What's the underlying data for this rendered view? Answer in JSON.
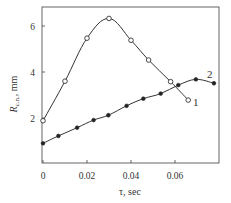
{
  "chart_data": {
    "type": "line",
    "title": "",
    "xlabel": "τ, sec",
    "ylabel": "R",
    "ylabel_subscript": "c.n.",
    "ylabel_unit": ", mm",
    "xlim": [
      0,
      0.08
    ],
    "ylim": [
      0,
      6.8
    ],
    "grid": false,
    "legend": "inline curve labels",
    "x_ticks": [
      0,
      0.02,
      0.04,
      0.06
    ],
    "x_tick_labels": [
      "0",
      "0.02",
      "0.04",
      "0.06"
    ],
    "y_ticks": [
      2,
      4,
      6
    ],
    "y_tick_labels": [
      "2",
      "4",
      "6"
    ],
    "series": [
      {
        "name": "1",
        "marker": "open-circle",
        "x": [
          0.0,
          0.01,
          0.02,
          0.03,
          0.04,
          0.048,
          0.058,
          0.066
        ],
        "y": [
          1.88,
          3.6,
          5.47,
          6.33,
          5.38,
          4.52,
          3.58,
          2.78
        ]
      },
      {
        "name": "2",
        "marker": "filled-circle",
        "x": [
          0.0,
          0.007,
          0.0155,
          0.023,
          0.0297,
          0.038,
          0.0456,
          0.0535,
          0.0615,
          0.0695,
          0.0777
        ],
        "y": [
          0.9,
          1.22,
          1.58,
          1.91,
          2.12,
          2.53,
          2.84,
          3.06,
          3.43,
          3.68,
          3.51
        ]
      }
    ]
  }
}
